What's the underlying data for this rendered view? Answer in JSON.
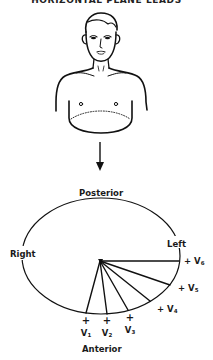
{
  "figure": {
    "title": "HORIZONTAL PLANE LEADS",
    "illustration": "male-torso-with-horizontal-plane",
    "arrow": "down-arrow"
  },
  "plane_diagram": {
    "labels": {
      "posterior": "Posterior",
      "anterior": "Anterior",
      "right": "Right",
      "left": "Left"
    },
    "leads": [
      {
        "id": "V1",
        "name": "V",
        "sub": "1",
        "polarity": "+"
      },
      {
        "id": "V2",
        "name": "V",
        "sub": "2",
        "polarity": "+"
      },
      {
        "id": "V3",
        "name": "V",
        "sub": "3",
        "polarity": "+"
      },
      {
        "id": "V4",
        "name": "V",
        "sub": "4",
        "polarity": "+"
      },
      {
        "id": "V5",
        "name": "V",
        "sub": "5",
        "polarity": "+"
      },
      {
        "id": "V6",
        "name": "V",
        "sub": "6",
        "polarity": "+"
      }
    ]
  }
}
